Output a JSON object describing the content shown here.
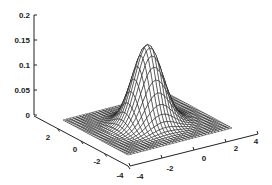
{
  "chart_data": {
    "type": "surface_mesh",
    "title": "",
    "function": "z = exp(-(x^2 + y^2)/2) / (2*pi)",
    "x": {
      "label": "",
      "range": [
        -4,
        4
      ],
      "ticks": [
        -4,
        -2,
        0,
        2,
        4
      ],
      "tick_labels": [
        "-4",
        "-2",
        "0",
        "2",
        "4"
      ]
    },
    "y": {
      "label": "",
      "range": [
        -4,
        4
      ],
      "ticks": [
        -4,
        -2,
        0,
        2
      ],
      "tick_labels": [
        "-4",
        "-2",
        "0",
        "2"
      ]
    },
    "z": {
      "label": "",
      "range": [
        0,
        0.2
      ],
      "ticks": [
        0,
        0.05,
        0.1,
        0.15,
        0.2
      ],
      "tick_labels": [
        "0",
        "0.05",
        "0.1",
        "0.15",
        "0.2"
      ]
    },
    "peak": {
      "x": 0,
      "y": 0,
      "z": 0.159
    },
    "grid_lines": 33,
    "grid": false,
    "colors": {
      "mesh": "#111111",
      "face": "#ffffff",
      "axis": "#222222"
    }
  }
}
